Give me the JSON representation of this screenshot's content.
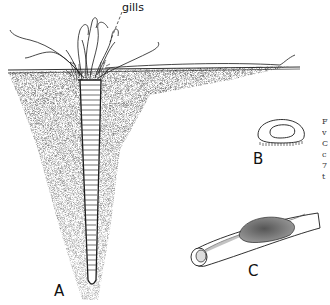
{
  "figure": {
    "labels": {
      "gills": "gills",
      "panel_a": "A",
      "panel_b": "B",
      "panel_c": "C"
    },
    "cut_off_caption_fragments": [
      "F",
      "v",
      "C",
      "c",
      "7",
      "t"
    ],
    "colors": {
      "ink": "#1a1a1a",
      "sediment_stipple": "#9a9a9a",
      "background": "#ffffff"
    }
  }
}
